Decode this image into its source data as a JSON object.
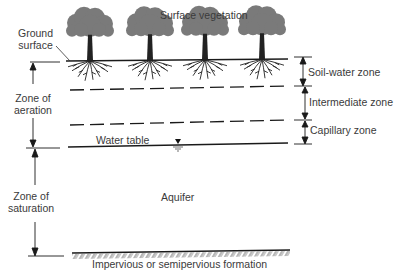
{
  "diagram": {
    "title_labels": {
      "ground_surface": [
        "Ground",
        "surface"
      ],
      "surface_vegetation": "Surface vegetation"
    },
    "left_zones": [
      {
        "id": "aeration",
        "lines": [
          "Zone of",
          "aeration"
        ]
      },
      {
        "id": "saturation",
        "lines": [
          "Zone of",
          "saturation"
        ]
      }
    ],
    "right_zones": [
      {
        "id": "soil-water",
        "label": "Soil-water zone"
      },
      {
        "id": "intermediate",
        "label": "Intermediate zone"
      },
      {
        "id": "capillary",
        "label": "Capillary zone"
      }
    ],
    "water_table_label": "Water table",
    "aquifer_label": "Aquifer",
    "formation_label": "Impervious or semipervious formation",
    "tree_count": 4,
    "colors": {
      "line": "#1a1a1a",
      "foliage": "#7a7a7a",
      "trunk": "#222222",
      "text": "#3a3a3a"
    }
  }
}
